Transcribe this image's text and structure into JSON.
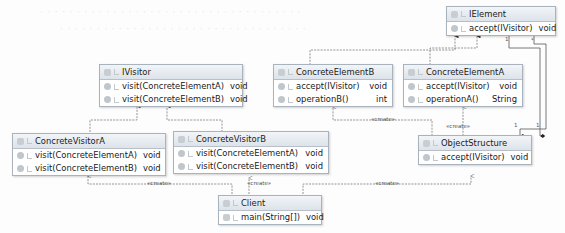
{
  "diagram": {
    "type": "UML class diagram (Visitor pattern)",
    "classes": {
      "ielement": {
        "name": "IElement",
        "methods": [
          {
            "name": "accept(IVisitor)",
            "type": "void"
          }
        ]
      },
      "ivisitor": {
        "name": "IVisitor",
        "methods": [
          {
            "name": "visit(ConcreteElementA)",
            "type": "void"
          },
          {
            "name": "visit(ConcreteElementB)",
            "type": "void"
          }
        ]
      },
      "concrete_element_b": {
        "name": "ConcreteElementB",
        "methods": [
          {
            "name": "accept(IVisitor)",
            "type": "void"
          },
          {
            "name": "operationB()",
            "type": "int"
          }
        ]
      },
      "concrete_element_a": {
        "name": "ConcreteElementA",
        "methods": [
          {
            "name": "accept(IVisitor)",
            "type": "void"
          },
          {
            "name": "operationA()",
            "type": "String"
          }
        ]
      },
      "concrete_visitor_a": {
        "name": "ConcreteVisitorA",
        "methods": [
          {
            "name": "visit(ConcreteElementA)",
            "type": "void"
          },
          {
            "name": "visit(ConcreteElementB)",
            "type": "void"
          }
        ]
      },
      "concrete_visitor_b": {
        "name": "ConcreteVisitorB",
        "methods": [
          {
            "name": "visit(ConcreteElementA)",
            "type": "void"
          },
          {
            "name": "visit(ConcreteElementB)",
            "type": "void"
          }
        ]
      },
      "object_structure": {
        "name": "ObjectStructure",
        "methods": [
          {
            "name": "accept(IVisitor)",
            "type": "void"
          }
        ]
      },
      "client": {
        "name": "Client",
        "methods": [
          {
            "name": "main(String[])",
            "type": "void"
          }
        ]
      }
    },
    "labels": {
      "create": "«create»",
      "mult_one": "1",
      "mult_many": "*"
    }
  }
}
